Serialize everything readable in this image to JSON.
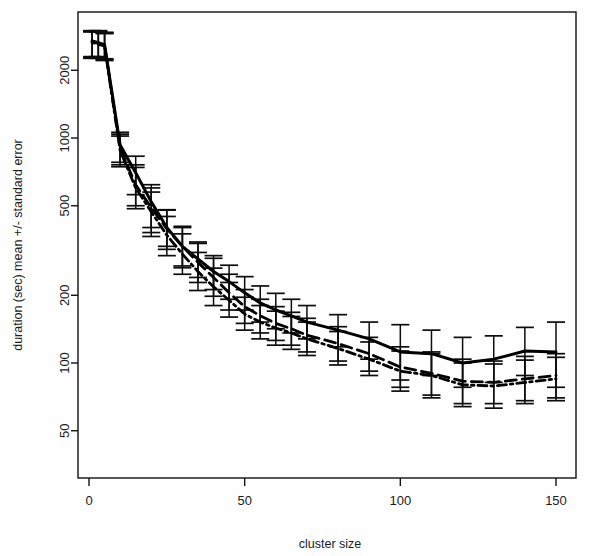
{
  "chart_data": {
    "type": "line",
    "title": "",
    "xlabel": "cluster size",
    "ylabel": "duration (sec) mean +/- standard error",
    "xlim": [
      -2,
      156
    ],
    "ylim": [
      40,
      3000
    ],
    "yscale": "log",
    "xscale": "linear",
    "grid": false,
    "legend": "none",
    "xticks": [
      0,
      50,
      100,
      150
    ],
    "xticklabels": [
      "0",
      "50",
      "100",
      "150"
    ],
    "yticks": [
      50,
      100,
      200,
      500,
      1000,
      2000
    ],
    "yticklabels": [
      "50",
      "100",
      "200",
      "500",
      "1000",
      "2000"
    ],
    "errorbars": true,
    "series": [
      {
        "name": "solid",
        "linestyle": "solid",
        "color": "#000000",
        "x": [
          1,
          3,
          5,
          10,
          15,
          20,
          25,
          30,
          35,
          40,
          45,
          50,
          55,
          60,
          65,
          70,
          80,
          90,
          100,
          110,
          120,
          130,
          140,
          150
        ],
        "y": [
          2700,
          2650,
          2600,
          930,
          700,
          520,
          400,
          330,
          290,
          255,
          230,
          205,
          185,
          172,
          162,
          152,
          140,
          128,
          112,
          110,
          100,
          104,
          113,
          112
        ],
        "yerr_low": [
          2300,
          2300,
          2250,
          780,
          560,
          400,
          330,
          270,
          240,
          212,
          192,
          172,
          152,
          142,
          136,
          128,
          118,
          104,
          84,
          88,
          78,
          82,
          88,
          78
        ],
        "yerr_high": [
          3000,
          3000,
          2950,
          1060,
          830,
          620,
          480,
          400,
          345,
          300,
          272,
          242,
          220,
          204,
          192,
          180,
          164,
          152,
          148,
          140,
          130,
          132,
          144,
          152
        ]
      },
      {
        "name": "dashed",
        "linestyle": "dashed",
        "color": "#000000",
        "x": [
          1,
          3,
          5,
          10,
          15,
          20,
          25,
          30,
          35,
          40,
          45,
          50,
          55,
          60,
          65,
          70,
          80,
          90,
          100,
          110,
          120,
          130,
          140,
          150
        ],
        "y": [
          2680,
          2630,
          2580,
          900,
          620,
          490,
          395,
          330,
          280,
          240,
          205,
          178,
          162,
          150,
          142,
          133,
          122,
          110,
          96,
          90,
          83,
          82,
          85,
          88
        ],
        "yerr_low": [
          2280,
          2280,
          2230,
          760,
          500,
          380,
          320,
          265,
          228,
          198,
          172,
          150,
          136,
          126,
          120,
          112,
          102,
          92,
          78,
          72,
          66,
          66,
          68,
          70
        ],
        "yerr_high": [
          2980,
          2980,
          2930,
          1040,
          760,
          600,
          478,
          405,
          340,
          292,
          248,
          212,
          192,
          178,
          168,
          158,
          145,
          130,
          118,
          112,
          104,
          102,
          107,
          110
        ]
      },
      {
        "name": "dotted",
        "linestyle": "dotted",
        "color": "#000000",
        "x": [
          1,
          3,
          5,
          10,
          15,
          20,
          25,
          30,
          35,
          40,
          45,
          50,
          55,
          60,
          65,
          70,
          80,
          90,
          100,
          110,
          120,
          130,
          140,
          150
        ],
        "y": [
          2660,
          2610,
          2560,
          880,
          600,
          470,
          370,
          305,
          255,
          218,
          190,
          165,
          152,
          143,
          136,
          128,
          116,
          104,
          92,
          88,
          80,
          79,
          82,
          85
        ],
        "yerr_low": [
          2260,
          2260,
          2210,
          745,
          485,
          365,
          300,
          248,
          210,
          180,
          160,
          140,
          128,
          120,
          115,
          108,
          98,
          88,
          75,
          70,
          64,
          63,
          66,
          68
        ],
        "yerr_high": [
          2960,
          2960,
          2910,
          1020,
          740,
          575,
          448,
          375,
          310,
          264,
          228,
          196,
          180,
          170,
          161,
          152,
          138,
          124,
          113,
          110,
          100,
          99,
          103,
          106
        ]
      }
    ]
  },
  "axis": {
    "x_title": "cluster size",
    "y_title": "duration (sec) mean +/- standard error"
  }
}
